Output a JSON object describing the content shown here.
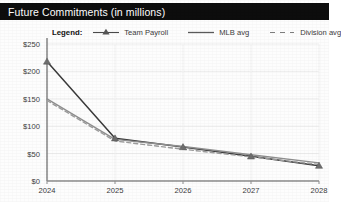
{
  "title": {
    "text": "Future Commitments (in millions)"
  },
  "legend": {
    "label": "Legend:",
    "entries": [
      {
        "name": "Team Payroll",
        "style": "line-marker",
        "color": "#3a3a3a"
      },
      {
        "name": "MLB avg",
        "style": "solid",
        "color": "#8a8a8a"
      },
      {
        "name": "Division avg",
        "style": "dashed",
        "color": "#9a9a9a"
      }
    ]
  },
  "chart_data": {
    "type": "line",
    "title": "Future Commitments (in millions)",
    "xlabel": "",
    "ylabel": "",
    "x": [
      "2024",
      "2025",
      "2026",
      "2027",
      "2028"
    ],
    "categories": [
      "2024",
      "2025",
      "2026",
      "2027",
      "2028"
    ],
    "ylim": [
      0,
      250
    ],
    "yticks": [
      0,
      50,
      100,
      150,
      200,
      250
    ],
    "ytick_labels": [
      "$0",
      "$50",
      "$100",
      "$150",
      "$200",
      "$250"
    ],
    "xtick_labels": [
      "2024",
      "2025",
      "2026",
      "2027",
      "2028"
    ],
    "grid": true,
    "legend_position": "top",
    "series": [
      {
        "name": "Team Payroll",
        "color": "#3a3a3a",
        "style": "solid",
        "marker": "triangle",
        "values": [
          218,
          78,
          62,
          45,
          28
        ]
      },
      {
        "name": "MLB avg",
        "color": "#8f8f8f",
        "style": "solid",
        "marker": "none",
        "values": [
          150,
          76,
          63,
          48,
          33
        ]
      },
      {
        "name": "Division avg",
        "color": "#9c9c9c",
        "style": "dashed",
        "marker": "none",
        "values": [
          147,
          73,
          58,
          44,
          30
        ]
      }
    ]
  },
  "axis": {
    "y_labels": [
      "$250",
      "$200",
      "$150",
      "$100",
      "$50",
      "$0"
    ],
    "x_labels": [
      "2024",
      "2025",
      "2026",
      "2027",
      "2028"
    ]
  }
}
